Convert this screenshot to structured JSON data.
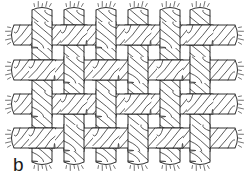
{
  "figure": {
    "label": "b",
    "caption_letter": "b",
    "type": "textile-weave-diagram",
    "weave_type": "plain weave",
    "background_color": "#ffffff",
    "line_color": "#1a1a1a",
    "fill_color": "#ffffff",
    "shade_color": "#7a7a7a"
  },
  "canvas": {
    "width": 248,
    "height": 185
  },
  "weave": {
    "warp_count": 6,
    "weft_count": 4,
    "warp_label": "warp yarn",
    "weft_label": "weft yarn",
    "yarn_style": "twisted multi-ply cord",
    "ply_hatch_direction": "diagonal",
    "warp_centers_x": [
      42,
      74,
      106,
      138,
      170,
      200
    ],
    "weft_centers_y": [
      35,
      70,
      104,
      138
    ],
    "warp_width": 20,
    "weft_height": 20,
    "warp_top_y": 10,
    "warp_bottom_y": 162,
    "weft_left_x": 14,
    "weft_right_x": 235,
    "twist_pitch": 9,
    "frayed_ends": {
      "top": 6,
      "bottom": 6,
      "left": 4,
      "right": 4,
      "label": "frayed yarn end"
    },
    "interlacing": [
      [
        1,
        0,
        1,
        0,
        1,
        0
      ],
      [
        0,
        1,
        0,
        1,
        0,
        1
      ],
      [
        1,
        0,
        1,
        0,
        1,
        0
      ],
      [
        0,
        1,
        0,
        1,
        0,
        1
      ]
    ],
    "interlacing_legend": {
      "1": "warp over weft",
      "0": "weft over warp"
    }
  }
}
